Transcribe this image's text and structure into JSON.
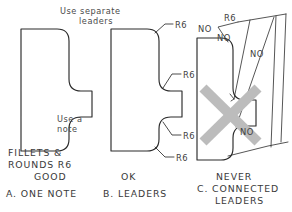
{
  "drawing": {
    "title_visible": false,
    "background_color": "#ffffff",
    "line_color": "#2b2b2b",
    "text_color": "#3a3a3a",
    "strikethrough_color": "#b8b8b8"
  },
  "figure_a": {
    "note_line1": "Use a",
    "note_line2": "note",
    "caption_line1": "FILLETS &",
    "caption_line2": "ROUNDS R6",
    "caption_line3": "GOOD",
    "caption_line4": "A. ONE NOTE"
  },
  "figure_b": {
    "header_line1": "Use  separate",
    "header_line2": "leaders",
    "leader_labels": [
      "R6",
      "R6",
      "R6",
      "R6"
    ],
    "caption_line1": "OK",
    "caption_line2": "B. LEADERS"
  },
  "figure_c": {
    "radius_label": "R6",
    "no_labels": [
      "NO",
      "NO",
      "NO",
      "NO"
    ],
    "caption_line1": "NEVER",
    "caption_line2": "C. CONNECTED",
    "caption_line3": "LEADERS",
    "marked_invalid": true
  }
}
